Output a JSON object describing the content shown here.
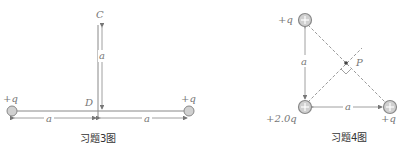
{
  "figure3": {
    "caption": "习题3图",
    "point_c": "C",
    "point_d": "D",
    "charge_left": "+q",
    "charge_right": "+q",
    "dim_vertical": "a",
    "dim_left": "a",
    "dim_right": "a"
  },
  "figure4": {
    "caption": "习题4图",
    "point_p": "P",
    "charge_top": "+q",
    "charge_bottom_left": "+2.0q",
    "charge_bottom_right": "+q",
    "dim_vertical": "a",
    "dim_horizontal": "a"
  },
  "colors": {
    "line": "#888888",
    "charge_fill": "#d0d0d0",
    "charge_stroke": "#888888",
    "dashed": "#999999"
  }
}
